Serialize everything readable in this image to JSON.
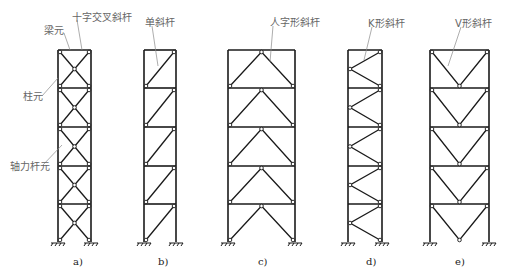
{
  "figure": {
    "panels": [
      {
        "id": "a",
        "caption": "a)",
        "bracing": "cross",
        "callouts": [
          "梁元",
          "十字交叉斜杆",
          "柱元",
          "轴力杆元"
        ]
      },
      {
        "id": "b",
        "caption": "b)",
        "bracing": "single-diagonal",
        "callouts": [
          "单斜杆"
        ]
      },
      {
        "id": "c",
        "caption": "c)",
        "bracing": "chevron-inverted-v",
        "callouts": [
          "人字形斜杆"
        ]
      },
      {
        "id": "d",
        "caption": "d)",
        "bracing": "k-brace",
        "callouts": [
          "K形斜杆"
        ]
      },
      {
        "id": "e",
        "caption": "e)",
        "bracing": "v-brace",
        "callouts": [
          "V形斜杆"
        ]
      }
    ],
    "labels": {
      "beam_element": "梁元",
      "cross_brace": "十字交叉斜杆",
      "column_element": "柱元",
      "axial_bar_element": "轴力杆元",
      "single_brace": "单斜杆",
      "chevron_brace": "人字形斜杆",
      "k_brace": "K形斜杆",
      "v_brace": "V形斜杆"
    },
    "captions": {
      "a": "a)",
      "b": "b)",
      "c": "c)",
      "d": "d)",
      "e": "e)"
    },
    "stories": 5,
    "colors": {
      "line": "#1a1a1a",
      "leader": "#8a8a8a",
      "label": "#666666"
    }
  }
}
